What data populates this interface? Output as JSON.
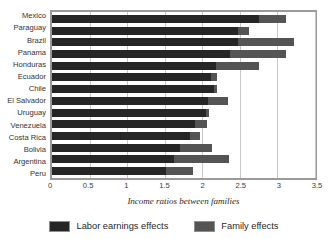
{
  "chart_data": {
    "type": "bar",
    "orientation": "horizontal",
    "stacked": true,
    "title": "",
    "xlabel": "Income ratios between families",
    "ylabel": "",
    "xlim": [
      0,
      3.5
    ],
    "xticks": [
      0,
      0.5,
      1,
      1.5,
      2,
      2.5,
      3,
      3.5
    ],
    "xtick_labels": [
      "0",
      "0.5",
      "1",
      "1.5",
      "2",
      "2.5",
      "3",
      "3.5"
    ],
    "grid": true,
    "grid_axis": "x",
    "legend_position": "bottom",
    "categories": [
      "Mexico",
      "Paraguay",
      "Brazil",
      "Panama",
      "Honduras",
      "Ecuador",
      "Chile",
      "El Salvador",
      "Uruguay",
      "Venezuela",
      "Costa Rica",
      "Bolivia",
      "Argentina",
      "Peru"
    ],
    "series": [
      {
        "name": "Labor earnings effects",
        "color": "#262626",
        "values": [
          2.75,
          2.48,
          2.47,
          2.37,
          2.18,
          2.12,
          2.16,
          2.07,
          2.05,
          1.9,
          1.84,
          1.71,
          1.63,
          1.52
        ]
      },
      {
        "name": "Family effects",
        "color": "#545454",
        "values": [
          0.36,
          0.14,
          0.75,
          0.74,
          0.57,
          0.08,
          0.03,
          0.27,
          0.04,
          0.16,
          0.13,
          0.42,
          0.72,
          0.36
        ]
      }
    ],
    "totals": [
      3.11,
      2.62,
      3.22,
      3.11,
      2.75,
      2.2,
      2.19,
      2.34,
      2.09,
      2.06,
      1.97,
      2.13,
      2.35,
      1.88
    ]
  },
  "legend": {
    "items": [
      {
        "label": "Labor earnings effects",
        "color": "#262626"
      },
      {
        "label": "Family effects",
        "color": "#545454"
      }
    ]
  },
  "colors": {
    "labor": "#262626",
    "family": "#545454",
    "frame": "#9a9a9a",
    "grid": "#c9c9c9",
    "background": "#ffffff"
  }
}
